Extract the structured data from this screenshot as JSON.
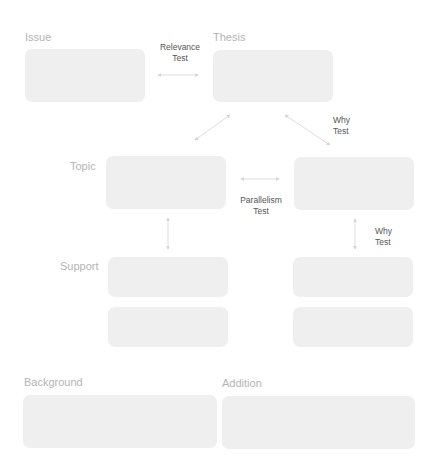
{
  "diagram": {
    "labels": {
      "issue": "Issue",
      "thesis": "Thesis",
      "topic": "Topic",
      "support": "Support",
      "background": "Background",
      "addition": "Addition"
    },
    "tests": {
      "relevance_line1": "Relevance",
      "relevance_line2": "Test",
      "why_top_line1": "Why",
      "why_top_line2": "Test",
      "parallelism_line1": "Parallelism",
      "parallelism_line2": "Test",
      "why_right_line1": "Why",
      "why_right_line2": "Test"
    },
    "boxes": [
      {
        "id": "issue",
        "content": ""
      },
      {
        "id": "thesis",
        "content": ""
      },
      {
        "id": "topic-left",
        "content": ""
      },
      {
        "id": "topic-right",
        "content": ""
      },
      {
        "id": "support-left-1",
        "content": ""
      },
      {
        "id": "support-right-1",
        "content": ""
      },
      {
        "id": "support-left-2",
        "content": ""
      },
      {
        "id": "support-right-2",
        "content": ""
      },
      {
        "id": "background",
        "content": ""
      },
      {
        "id": "addition",
        "content": ""
      }
    ],
    "colors": {
      "box_fill": "#efefef",
      "label_text": "#b4b4b4",
      "test_text": "#555555",
      "arrow": "#d4d4d4"
    }
  }
}
